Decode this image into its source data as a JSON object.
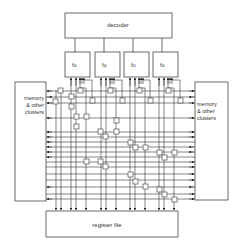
{
  "diagram": {
    "decoder": {
      "label": "decoder"
    },
    "functional_units": [
      {
        "label": "fu"
      },
      {
        "label": "fu"
      },
      {
        "label": "fu"
      },
      {
        "label": "fu"
      }
    ],
    "memory_left": {
      "lines": [
        "memory",
        "& other",
        "clusters"
      ]
    },
    "memory_right": {
      "lines": [
        "memory",
        "& other",
        "clusters"
      ]
    },
    "register_file": {
      "label": "register file"
    },
    "colors": {
      "stroke": "#333333",
      "background": "#ffffff"
    }
  }
}
